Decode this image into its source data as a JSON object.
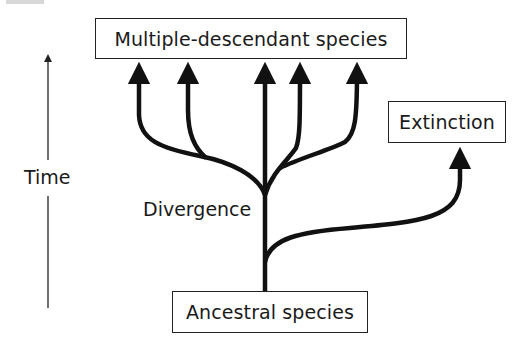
{
  "diagram": {
    "type": "phylogenetic-divergence",
    "nodes": {
      "descendants": {
        "label": "Multiple-descendant species"
      },
      "extinction": {
        "label": "Extinction"
      },
      "ancestral": {
        "label": "Ancestral species"
      }
    },
    "annotations": {
      "divergence": "Divergence",
      "time_axis": "Time"
    },
    "branches": {
      "descendant_count": 5,
      "extinct_count": 1
    },
    "colors": {
      "stroke": "#111111",
      "box_border": "#222222",
      "axis": "#333333",
      "background": "#ffffff"
    }
  }
}
